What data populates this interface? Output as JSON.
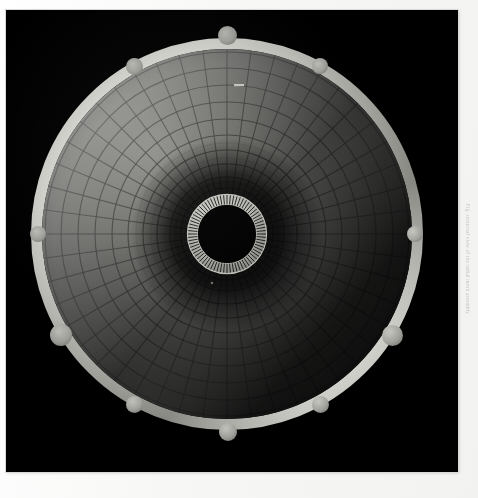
{
  "page": {
    "background_color": "#f7f7f6",
    "width": 478,
    "height": 498
  },
  "photo_panel": {
    "name": "radial-mesh-dish-photograph",
    "background_color": "#000000",
    "x": 6,
    "y": 10,
    "width": 452,
    "height": 462
  },
  "caption": {
    "text": "Fig. sectional view of the radial mesh assembly",
    "color": "#b4b4b0",
    "orientation": "vertical"
  },
  "chart_data": {
    "type": "polar-mesh",
    "center": {
      "x": 221,
      "y": 224
    },
    "outer_radius": 196,
    "rim_band_width": 11,
    "hub": {
      "outer_radius": 40,
      "inner_radius": 29,
      "tick_count": 72,
      "tick_color": "#cfcfc9"
    },
    "rings": {
      "count": 11,
      "radii": [
        196,
        182,
        166,
        149,
        132,
        115,
        99,
        84,
        70,
        57,
        46
      ],
      "line_color": "#1a1a1a"
    },
    "spokes": {
      "count": 48,
      "line_color": "#1a1a1a"
    },
    "illumination": {
      "direction_deg": 215,
      "bright_color": "#d8d8d2",
      "mid_color": "#8d8d88",
      "dark_color": "#1b1b1b"
    },
    "fiducial_markers": {
      "count": 10,
      "color": "#a8a8a3",
      "points": [
        {
          "label": "top",
          "x": 227,
          "y": 35,
          "r": 9.5
        },
        {
          "label": "upper-right",
          "x": 320,
          "y": 66,
          "r": 8.0
        },
        {
          "label": "right-upper",
          "x": 415,
          "y": 234,
          "r": 8.0
        },
        {
          "label": "right-lower",
          "x": 392,
          "y": 335,
          "r": 10.5
        },
        {
          "label": "lower-right",
          "x": 320,
          "y": 404,
          "r": 8.5
        },
        {
          "label": "bottom",
          "x": 228,
          "y": 432,
          "r": 9.0
        },
        {
          "label": "lower-left",
          "x": 134,
          "y": 404,
          "r": 8.5
        },
        {
          "label": "left-lower",
          "x": 61,
          "y": 335,
          "r": 11.0
        },
        {
          "label": "left-upper",
          "x": 38,
          "y": 234,
          "r": 8.0
        },
        {
          "label": "upper-left",
          "x": 134,
          "y": 66,
          "r": 8.5
        }
      ]
    }
  }
}
